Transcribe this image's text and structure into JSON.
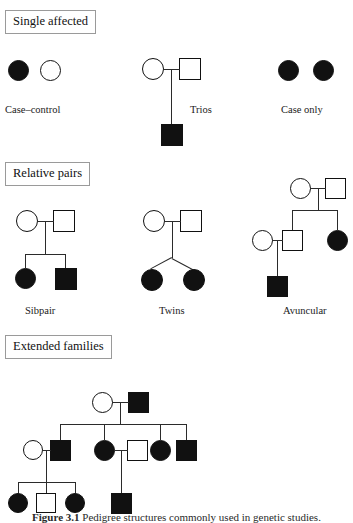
{
  "figure": {
    "caption_number": "Figure 3.1",
    "caption_text": "Pedigree structures commonly used in genetic studies.",
    "background_color": "#ffffff",
    "line_color": "#2b2b2b",
    "affected_color": "#111111",
    "unaffected_color": "#ffffff"
  },
  "sections": [
    {
      "id": "single-affected",
      "label": "Single affected"
    },
    {
      "id": "relative-pairs",
      "label": "Relative pairs"
    },
    {
      "id": "extended-families",
      "label": "Extended families"
    }
  ],
  "designs": [
    {
      "id": "case-control",
      "label": "Case–control",
      "section": "single-affected"
    },
    {
      "id": "trios",
      "label": "Trios",
      "section": "single-affected"
    },
    {
      "id": "case-only",
      "label": "Case only",
      "section": "single-affected"
    },
    {
      "id": "sibpair",
      "label": "Sibpair",
      "section": "relative-pairs"
    },
    {
      "id": "twins",
      "label": "Twins",
      "section": "relative-pairs"
    },
    {
      "id": "avuncular",
      "label": "Avuncular",
      "section": "relative-pairs"
    },
    {
      "id": "extended",
      "label": "",
      "section": "extended-families"
    }
  ],
  "legend": {
    "circle_meaning": "female",
    "square_meaning": "male",
    "filled_meaning": "affected",
    "open_meaning": "unaffected"
  },
  "pedigrees": {
    "case_control": {
      "members": [
        {
          "name": "case-female",
          "shape": "circle",
          "affected": true
        },
        {
          "name": "control-female",
          "shape": "circle",
          "affected": false
        }
      ]
    },
    "trios": {
      "members": [
        {
          "name": "mother",
          "shape": "circle",
          "affected": false
        },
        {
          "name": "father",
          "shape": "square",
          "affected": false
        },
        {
          "name": "affected-child",
          "shape": "square",
          "affected": true
        }
      ]
    },
    "case_only": {
      "members": [
        {
          "name": "case-female-1",
          "shape": "circle",
          "affected": true
        },
        {
          "name": "case-female-2",
          "shape": "circle",
          "affected": true
        }
      ]
    },
    "sibpair": {
      "members": [
        {
          "name": "mother",
          "shape": "circle",
          "affected": false
        },
        {
          "name": "father",
          "shape": "square",
          "affected": false
        },
        {
          "name": "affected-daughter",
          "shape": "circle",
          "affected": true
        },
        {
          "name": "affected-son",
          "shape": "square",
          "affected": true
        }
      ]
    },
    "twins": {
      "members": [
        {
          "name": "mother",
          "shape": "circle",
          "affected": false
        },
        {
          "name": "father",
          "shape": "square",
          "affected": false
        },
        {
          "name": "affected-twin-1",
          "shape": "circle",
          "affected": true
        },
        {
          "name": "affected-twin-2",
          "shape": "circle",
          "affected": true
        }
      ]
    },
    "avuncular": {
      "members": [
        {
          "name": "grandmother",
          "shape": "circle",
          "affected": false
        },
        {
          "name": "grandfather",
          "shape": "square",
          "affected": false
        },
        {
          "name": "son",
          "shape": "square",
          "affected": false
        },
        {
          "name": "affected-aunt",
          "shape": "circle",
          "affected": true
        },
        {
          "name": "son-spouse",
          "shape": "circle",
          "affected": false
        },
        {
          "name": "affected-nephew",
          "shape": "square",
          "affected": true
        }
      ]
    },
    "extended": {
      "generation_1": [
        {
          "name": "founder-mother",
          "shape": "circle",
          "affected": false
        },
        {
          "name": "founder-father",
          "shape": "square",
          "affected": true
        }
      ],
      "generation_2": [
        {
          "name": "spouse-left",
          "shape": "circle",
          "affected": false
        },
        {
          "name": "son-1",
          "shape": "square",
          "affected": true
        },
        {
          "name": "daughter-1",
          "shape": "circle",
          "affected": true
        },
        {
          "name": "spouse-middle",
          "shape": "square",
          "affected": false
        },
        {
          "name": "daughter-2",
          "shape": "circle",
          "affected": true
        },
        {
          "name": "son-2",
          "shape": "square",
          "affected": true
        }
      ],
      "generation_3": [
        {
          "name": "grandchild-1",
          "shape": "circle",
          "affected": true
        },
        {
          "name": "grandchild-2",
          "shape": "square",
          "affected": false
        },
        {
          "name": "grandchild-3",
          "shape": "circle",
          "affected": true
        },
        {
          "name": "grandchild-4",
          "shape": "square",
          "affected": true
        }
      ]
    }
  }
}
